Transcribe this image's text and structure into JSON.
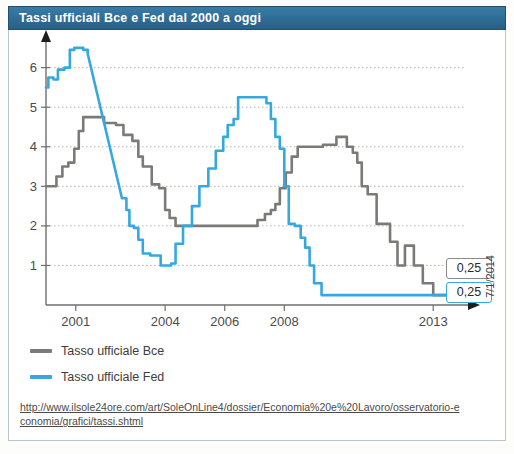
{
  "window": {
    "title": "Tassi ufficiali Bce e Fed dal 2000 a oggi"
  },
  "legend": {
    "items": [
      {
        "label": "Tasso ufficiale Bce",
        "color": "#7a7a78"
      },
      {
        "label": "Tasso ufficiale Fed",
        "color": "#35a8e0"
      }
    ]
  },
  "callouts": {
    "bce_value": "0,25",
    "fed_value": "0,25",
    "date_label": "7/1/2014"
  },
  "source": {
    "url": "http://www.ilsole24ore.com/art/SoleOnLine4/dossier/Economia%20e%20Lavoro/osservatorio-economia/grafici/tassi.shtml"
  },
  "chart_data": {
    "type": "line",
    "title": "Tassi ufficiali Bce e Fed dal 2000 a oggi",
    "xlabel": "",
    "ylabel": "",
    "xlim": [
      2000.0,
      2014.1
    ],
    "ylim": [
      0,
      6.8
    ],
    "grid": true,
    "grid_axis": "y",
    "legend_position": "below-left",
    "yticks": [
      1,
      2,
      3,
      4,
      5,
      6
    ],
    "ytick_labels": [
      "1",
      "2",
      "3",
      "4",
      "5",
      "6"
    ],
    "xticks": [
      2001,
      2004,
      2006,
      2008,
      2013
    ],
    "xtick_labels": [
      "2001",
      "2004",
      "2006",
      "2008",
      "2013"
    ],
    "annotations": [
      {
        "text": "0,25",
        "series": "Tasso ufficiale Bce",
        "x": 2014.0,
        "y": 0.25
      },
      {
        "text": "0,25",
        "series": "Tasso ufficiale Fed",
        "x": 2014.0,
        "y": 0.25
      },
      {
        "text": "7/1/2014",
        "orientation": "vertical",
        "x": 2014.1
      }
    ],
    "series": [
      {
        "name": "Tasso ufficiale Bce",
        "color": "#7a7a78",
        "step": true,
        "points": [
          [
            2000.0,
            3.0
          ],
          [
            2000.35,
            3.0
          ],
          [
            2000.35,
            3.25
          ],
          [
            2000.55,
            3.25
          ],
          [
            2000.55,
            3.5
          ],
          [
            2000.75,
            3.5
          ],
          [
            2000.75,
            3.6
          ],
          [
            2000.95,
            3.6
          ],
          [
            2000.95,
            3.95
          ],
          [
            2001.1,
            3.95
          ],
          [
            2001.1,
            4.4
          ],
          [
            2001.25,
            4.4
          ],
          [
            2001.25,
            4.75
          ],
          [
            2001.95,
            4.75
          ],
          [
            2001.95,
            4.6
          ],
          [
            2002.35,
            4.6
          ],
          [
            2002.35,
            4.55
          ],
          [
            2002.6,
            4.55
          ],
          [
            2002.6,
            4.3
          ],
          [
            2002.9,
            4.3
          ],
          [
            2002.9,
            4.15
          ],
          [
            2003.1,
            4.15
          ],
          [
            2003.1,
            3.75
          ],
          [
            2003.25,
            3.75
          ],
          [
            2003.25,
            3.5
          ],
          [
            2003.55,
            3.5
          ],
          [
            2003.55,
            3.05
          ],
          [
            2003.8,
            3.05
          ],
          [
            2003.8,
            2.95
          ],
          [
            2004.0,
            2.95
          ],
          [
            2004.0,
            2.4
          ],
          [
            2004.15,
            2.4
          ],
          [
            2004.15,
            2.2
          ],
          [
            2004.35,
            2.2
          ],
          [
            2004.35,
            2.0
          ],
          [
            2007.1,
            2.0
          ],
          [
            2007.1,
            2.15
          ],
          [
            2007.35,
            2.15
          ],
          [
            2007.35,
            2.3
          ],
          [
            2007.55,
            2.3
          ],
          [
            2007.55,
            2.4
          ],
          [
            2007.7,
            2.4
          ],
          [
            2007.7,
            2.55
          ],
          [
            2007.85,
            2.55
          ],
          [
            2007.85,
            2.95
          ],
          [
            2008.05,
            2.95
          ],
          [
            2008.05,
            3.35
          ],
          [
            2008.25,
            3.35
          ],
          [
            2008.25,
            3.75
          ],
          [
            2008.45,
            3.75
          ],
          [
            2008.45,
            4.0
          ],
          [
            2009.3,
            4.0
          ],
          [
            2009.3,
            4.05
          ],
          [
            2009.75,
            4.05
          ],
          [
            2009.75,
            4.25
          ],
          [
            2010.1,
            4.25
          ],
          [
            2010.1,
            4.0
          ],
          [
            2010.3,
            4.0
          ],
          [
            2010.3,
            3.85
          ],
          [
            2010.45,
            3.85
          ],
          [
            2010.45,
            3.6
          ],
          [
            2010.6,
            3.6
          ],
          [
            2010.6,
            3.0
          ],
          [
            2010.8,
            3.0
          ],
          [
            2010.8,
            2.8
          ],
          [
            2011.1,
            2.8
          ],
          [
            2011.1,
            2.05
          ],
          [
            2011.55,
            2.05
          ],
          [
            2011.55,
            1.6
          ],
          [
            2011.8,
            1.6
          ],
          [
            2011.8,
            1.0
          ],
          [
            2012.05,
            1.0
          ],
          [
            2012.05,
            1.5
          ],
          [
            2012.35,
            1.5
          ],
          [
            2012.35,
            1.0
          ],
          [
            2012.65,
            1.0
          ],
          [
            2012.65,
            0.55
          ],
          [
            2013.0,
            0.55
          ],
          [
            2013.0,
            0.25
          ],
          [
            2014.0,
            0.25
          ]
        ]
      },
      {
        "name": "Tasso ufficiale Fed",
        "color": "#35a8e0",
        "step": true,
        "points": [
          [
            2000.0,
            5.5
          ],
          [
            2000.08,
            5.5
          ],
          [
            2000.08,
            5.75
          ],
          [
            2000.25,
            5.75
          ],
          [
            2000.25,
            5.7
          ],
          [
            2000.4,
            5.7
          ],
          [
            2000.4,
            5.95
          ],
          [
            2000.62,
            5.95
          ],
          [
            2000.62,
            6.0
          ],
          [
            2000.8,
            6.0
          ],
          [
            2000.8,
            6.45
          ],
          [
            2000.95,
            6.45
          ],
          [
            2000.95,
            6.5
          ],
          [
            2001.25,
            6.5
          ],
          [
            2001.25,
            6.45
          ],
          [
            2001.4,
            6.45
          ],
          [
            2001.4,
            6.35
          ],
          [
            2002.55,
            2.7
          ],
          [
            2002.7,
            2.7
          ],
          [
            2002.7,
            2.4
          ],
          [
            2002.8,
            2.4
          ],
          [
            2002.8,
            2.0
          ],
          [
            2002.95,
            2.0
          ],
          [
            2002.95,
            1.95
          ],
          [
            2003.1,
            1.95
          ],
          [
            2003.1,
            1.65
          ],
          [
            2003.25,
            1.65
          ],
          [
            2003.25,
            1.3
          ],
          [
            2003.5,
            1.3
          ],
          [
            2003.5,
            1.25
          ],
          [
            2003.85,
            1.25
          ],
          [
            2003.85,
            1.0
          ],
          [
            2004.2,
            1.0
          ],
          [
            2004.2,
            1.05
          ],
          [
            2004.35,
            1.05
          ],
          [
            2004.35,
            1.55
          ],
          [
            2004.6,
            1.55
          ],
          [
            2004.6,
            2.0
          ],
          [
            2004.9,
            2.0
          ],
          [
            2004.9,
            2.5
          ],
          [
            2005.15,
            2.5
          ],
          [
            2005.15,
            3.0
          ],
          [
            2005.45,
            3.0
          ],
          [
            2005.45,
            3.45
          ],
          [
            2005.7,
            3.45
          ],
          [
            2005.7,
            3.9
          ],
          [
            2005.95,
            3.9
          ],
          [
            2005.95,
            4.25
          ],
          [
            2006.1,
            4.25
          ],
          [
            2006.1,
            4.55
          ],
          [
            2006.3,
            4.55
          ],
          [
            2006.3,
            4.7
          ],
          [
            2006.45,
            4.7
          ],
          [
            2006.45,
            5.25
          ],
          [
            2007.4,
            5.25
          ],
          [
            2007.4,
            5.1
          ],
          [
            2007.55,
            5.1
          ],
          [
            2007.55,
            4.7
          ],
          [
            2007.7,
            4.7
          ],
          [
            2007.7,
            4.25
          ],
          [
            2007.85,
            4.25
          ],
          [
            2007.85,
            3.95
          ],
          [
            2008.0,
            3.95
          ],
          [
            2008.0,
            3.0
          ],
          [
            2008.15,
            3.0
          ],
          [
            2008.15,
            2.05
          ],
          [
            2008.35,
            2.05
          ],
          [
            2008.35,
            2.0
          ],
          [
            2008.55,
            2.0
          ],
          [
            2008.55,
            1.7
          ],
          [
            2008.7,
            1.7
          ],
          [
            2008.7,
            1.45
          ],
          [
            2008.85,
            1.45
          ],
          [
            2008.85,
            1.0
          ],
          [
            2009.0,
            1.0
          ],
          [
            2009.0,
            0.55
          ],
          [
            2009.25,
            0.55
          ],
          [
            2009.25,
            0.25
          ],
          [
            2014.0,
            0.25
          ]
        ]
      }
    ]
  }
}
